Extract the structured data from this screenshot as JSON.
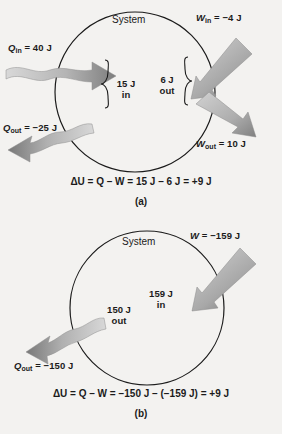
{
  "figure": {
    "background_color": "#f3f2f0",
    "line_color": "#1b1b1b",
    "arrow_dark": "#6e6e6e",
    "arrow_light": "#cfcfcf"
  },
  "panel_a": {
    "caption": "(a)",
    "system_label": "System",
    "q_in": {
      "symbol": "Q",
      "subscript": "in",
      "value": "=  40 J"
    },
    "q_out": {
      "symbol": "Q",
      "subscript": "out",
      "value": "=  −25 J"
    },
    "w_in": {
      "symbol": "W",
      "subscript": "in",
      "value": "=  −4 J"
    },
    "w_out": {
      "symbol": "W",
      "subscript": "out",
      "value": "=  10 J"
    },
    "net_heat": {
      "amount": "15 J",
      "direction": "in"
    },
    "net_work": {
      "amount": "6 J",
      "direction": "out"
    },
    "equation": "ΔU = Q – W = 15 J – 6 J  =  +9 J"
  },
  "panel_b": {
    "caption": "(b)",
    "system_label": "System",
    "w": {
      "symbol": "W",
      "subscript": "",
      "value": "=  −159 J"
    },
    "q_out": {
      "symbol": "Q",
      "subscript": "out",
      "value": "=  −150 J"
    },
    "net_heat": {
      "amount": "150 J",
      "direction": "out"
    },
    "net_work": {
      "amount": "159 J",
      "direction": "in"
    },
    "equation": "ΔU = Q – W =  −150 J – (−159 J)  =  +9 J"
  }
}
